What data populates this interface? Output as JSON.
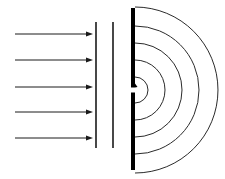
{
  "figure": {
    "width": 225,
    "height": 179,
    "background_color": "#ffffff",
    "stroke_color": "#000000"
  },
  "incoming_waves": {
    "label": "incident plane wave rays",
    "color": "#1a1a1a",
    "line_width": 1,
    "arrow_head_length": 7,
    "arrow_head_width": 5,
    "x_start": 15,
    "x_end": 93,
    "rays": [
      {
        "name": "ray-1",
        "y": 34
      },
      {
        "name": "ray-2",
        "y": 60
      },
      {
        "name": "ray-3",
        "y": 87
      },
      {
        "name": "ray-4",
        "y": 112
      },
      {
        "name": "ray-5",
        "y": 138
      }
    ]
  },
  "thin_barriers": {
    "label": "thin reference lines",
    "color": "#1a1a1a",
    "line_width": 1.6,
    "y_top": 22,
    "y_bottom": 148,
    "lines": [
      {
        "name": "thin-line-1",
        "x": 96
      },
      {
        "name": "thin-line-2",
        "x": 113
      }
    ]
  },
  "slit_barrier": {
    "label": "thick barrier with single slit",
    "color": "#000000",
    "x": 131,
    "width": 4,
    "y_top": 8,
    "y_bottom": 170,
    "slit": {
      "name": "slit-gap",
      "center_y": 90,
      "height": 5
    }
  },
  "diffracted_wavefronts": {
    "label": "circular diffracted wavefronts",
    "color": "#2b2b2b",
    "line_width": 1,
    "center_x": 135,
    "center_y": 90,
    "arc_count": 5,
    "radii": [
      13,
      30,
      47,
      64,
      83
    ],
    "arcs": [
      {
        "name": "wavefront-1",
        "radius": 13
      },
      {
        "name": "wavefront-2",
        "radius": 30
      },
      {
        "name": "wavefront-3",
        "radius": 47
      },
      {
        "name": "wavefront-4",
        "radius": 64
      },
      {
        "name": "wavefront-5",
        "radius": 83
      }
    ]
  }
}
